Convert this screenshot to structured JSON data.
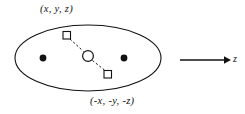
{
  "figure": {
    "title_top_label": "(x, y, z)",
    "bottom_label": "(-x, -y, -z)",
    "axis_label": "z",
    "stroke_color": "#121212",
    "fill_color": "#121212",
    "background_color": "#ffffff",
    "shapes": {
      "ellipse": {
        "cx": 88,
        "cy": 58,
        "rx": 73,
        "ry": 33
      },
      "filled_dots": [
        {
          "name": "left-filled-dot",
          "cx": 43,
          "cy": 58,
          "r": 3.4
        },
        {
          "name": "right-filled-dot",
          "cx": 124,
          "cy": 58,
          "r": 3.4
        }
      ],
      "open_squares": [
        {
          "name": "upper-left-open-square",
          "x": 63,
          "y": 31,
          "size": 7.5
        },
        {
          "name": "lower-right-open-square",
          "x": 104,
          "y": 70,
          "size": 7.5
        }
      ],
      "open_circle": {
        "name": "center-open-circle",
        "cx": 88,
        "cy": 56,
        "r": 5.4
      },
      "dashed_segments": [
        {
          "x1": 70,
          "y1": 39,
          "x2": 83,
          "y2": 52
        },
        {
          "x1": 93,
          "y1": 61,
          "x2": 105,
          "y2": 71
        }
      ],
      "arrow": {
        "x1": 180,
        "y1": 60,
        "x2": 229,
        "y2": 60
      }
    }
  }
}
